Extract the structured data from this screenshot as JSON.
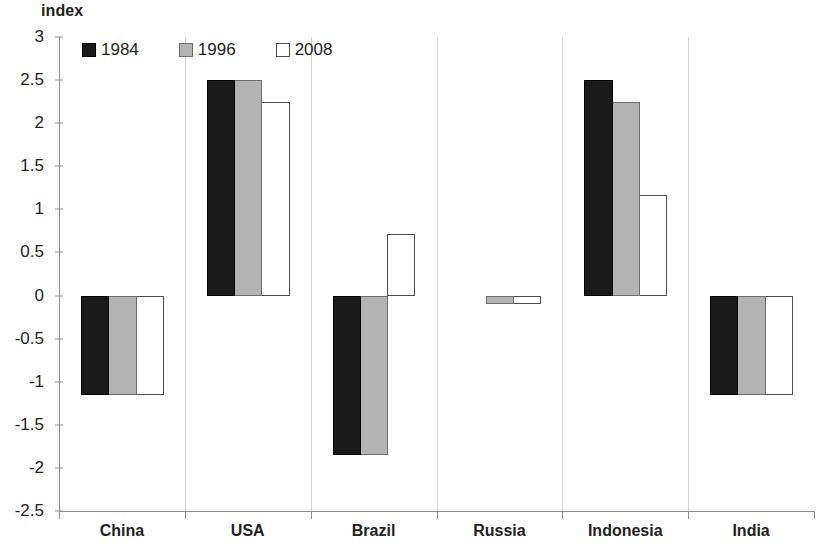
{
  "chart_data": {
    "type": "bar",
    "title": "",
    "ylabel": "index",
    "xlabel": "",
    "ylim": [
      -2.5,
      3
    ],
    "ytick_step": 0.5,
    "yticks": [
      3,
      2.5,
      2,
      1.5,
      1,
      0.5,
      0,
      -0.5,
      -1,
      -1.5,
      -2,
      -2.5
    ],
    "ytick_labels": [
      "3",
      "2.5",
      "2",
      "1.5",
      "1",
      "0.5",
      "0",
      "-0.5",
      "-1",
      "-1.5",
      "-2",
      "-2.5"
    ],
    "categories": [
      "China",
      "USA",
      "Brazil",
      "Russia",
      "Indonesia",
      "India"
    ],
    "grid": false,
    "legend_position": "top-left",
    "series": [
      {
        "name": "1984",
        "color": "#1a1a1a",
        "values": [
          -1.15,
          2.5,
          -1.85,
          0,
          2.5,
          -1.15
        ]
      },
      {
        "name": "1996",
        "color": "#b3b3b3",
        "values": [
          -1.15,
          2.5,
          -1.85,
          -0.1,
          2.25,
          -1.15
        ]
      },
      {
        "name": "2008",
        "color": "#ffffff",
        "values": [
          -1.15,
          2.24,
          0.71,
          -0.1,
          1.17,
          -1.15
        ]
      }
    ]
  },
  "axis": {
    "y_title": "index"
  },
  "legend": {
    "items": [
      {
        "label": "1984"
      },
      {
        "label": "1996"
      },
      {
        "label": "2008"
      }
    ]
  }
}
